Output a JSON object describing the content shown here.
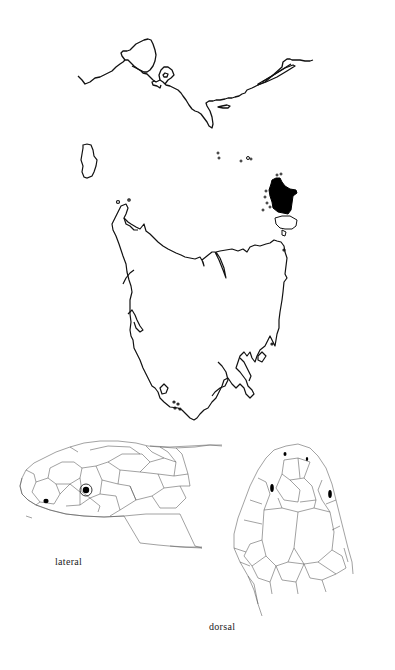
{
  "figure": {
    "map": {
      "regions": [
        {
          "name": "mainland-coast",
          "fill": "none"
        },
        {
          "name": "king-island",
          "fill": "none"
        },
        {
          "name": "tasmania",
          "fill": "none"
        },
        {
          "name": "flinders-island",
          "fill": "#000000",
          "highlighted": true
        }
      ],
      "stroke_color": "#111111"
    },
    "illustrations": {
      "lateral": {
        "label": "lateral"
      },
      "dorsal": {
        "label": "dorsal"
      }
    }
  }
}
